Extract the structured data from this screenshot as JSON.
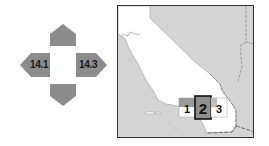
{
  "navigator": {
    "left_page": "14.1",
    "right_page": "14.3",
    "up_page": null,
    "down_page": null,
    "arrow_color": "#8c8c8c"
  },
  "locator_map": {
    "region": "California",
    "land_color": "#ffffff",
    "ocean_neighbor_color": "#d4d4d4",
    "tiles": [
      {
        "label": "1",
        "current": false
      },
      {
        "label": "2",
        "current": true
      },
      {
        "label": "3",
        "current": false
      }
    ]
  }
}
